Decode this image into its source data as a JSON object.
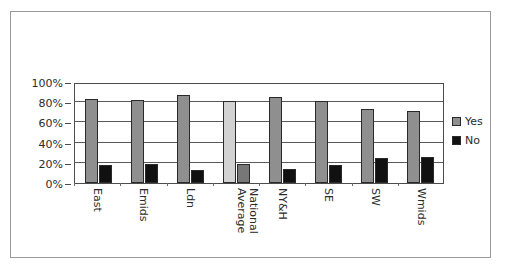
{
  "chart_data": {
    "type": "bar",
    "title": "",
    "subtitle": "",
    "xlabel": "",
    "ylabel": "",
    "ylim": [
      0,
      100
    ],
    "yticks": [
      "0%",
      "20%",
      "40%",
      "60%",
      "80%",
      "100%"
    ],
    "grid": true,
    "legend_position": "right",
    "categories": [
      "East",
      "Emids",
      "Ldn",
      "National Average",
      "NY&H",
      "SE",
      "SW",
      "Wmids"
    ],
    "category_lines": [
      [
        "East"
      ],
      [
        "Emids"
      ],
      [
        "Ldn"
      ],
      [
        "National",
        "Average"
      ],
      [
        "NY&H"
      ],
      [
        "SE"
      ],
      [
        "SW"
      ],
      [
        "Wmids"
      ]
    ],
    "highlight_category": "National Average",
    "series": [
      {
        "name": "Yes",
        "color": "#8f8f8f",
        "values": [
          83,
          82,
          87,
          81,
          85,
          81,
          73,
          71
        ]
      },
      {
        "name": "No",
        "color": "#111111",
        "values": [
          18,
          19,
          13,
          19,
          14,
          18,
          25,
          26
        ]
      }
    ]
  },
  "legend": {
    "items": [
      {
        "label": "Yes",
        "swatch": "gray-square-swatch"
      },
      {
        "label": "No",
        "swatch": "black-square-swatch"
      }
    ]
  },
  "colors": {
    "series_yes": "#8f8f8f",
    "series_no": "#111111",
    "series_yes_highlight": "#d2d2d2",
    "series_no_highlight": "#777777",
    "axis": "#4d4d4d",
    "gridline": "#5a5a5a",
    "card_border": "#9a9a9a",
    "text": "#2b2b2b",
    "background": "#ffffff"
  }
}
